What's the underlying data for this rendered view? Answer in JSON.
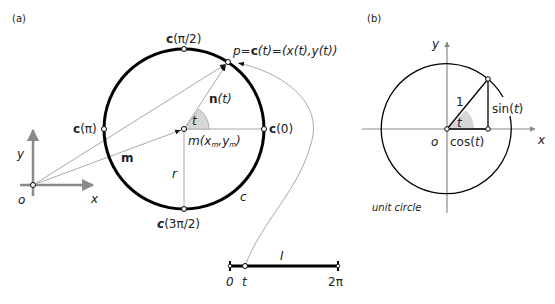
{
  "panel_a": {
    "label": "(a)",
    "axes": {
      "origin": "o",
      "x": "x",
      "y": "y"
    },
    "circle": {
      "name": "c",
      "radius_label": "r"
    },
    "points": {
      "top": {
        "bold": "c",
        "arg": "(π/2)"
      },
      "left": {
        "bold": "c",
        "arg": "(π)"
      },
      "right": {
        "bold": "c",
        "arg": "(0)"
      },
      "bottom": {
        "bold": "c",
        "arg": "(3π/2)"
      }
    },
    "point_p": {
      "pre": "p=",
      "bold": "c",
      "post": "(t)=(x(t),y(t))"
    },
    "center": {
      "pre": "m(x",
      "sub1": "m",
      "mid": ",y",
      "sub2": "m",
      "post": ")"
    },
    "vector_m": "m",
    "vector_n": {
      "bold": "n",
      "post": "(t)"
    },
    "angle": "t",
    "interval": {
      "name": "I",
      "start": "0",
      "t": "t",
      "end": "2π"
    }
  },
  "panel_b": {
    "label": "(b)",
    "axes": {
      "origin": "o",
      "x": "x",
      "y": "y"
    },
    "hyp": "1",
    "angle": "t",
    "sin": {
      "pre": "sin(",
      "arg": "t",
      "post": ")"
    },
    "cos": {
      "pre": "cos(",
      "arg": "t",
      "post": ")"
    },
    "caption": "unit circle"
  },
  "colors": {
    "ink": "#000000",
    "grey_axis": "#8a8a8a",
    "thin_line": "#a8a8a8",
    "angle_fill": "#d6d6d6"
  }
}
